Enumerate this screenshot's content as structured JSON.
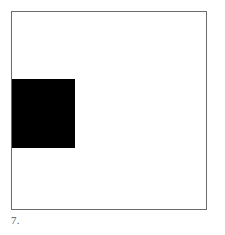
{
  "figure": {
    "caption": "7.",
    "canvas": {
      "width": 225,
      "height": 235,
      "background_color": "#ffffff"
    },
    "frame": {
      "name": "outer-square-frame",
      "stroke_color": "#6b6b6b",
      "stroke_width": 1,
      "fill_color": "#ffffff",
      "x": 11,
      "y": 11,
      "width": 196,
      "height": 199
    },
    "shapes": [
      {
        "name": "black-square",
        "type": "rectangle",
        "fill_color": "#000000",
        "x": 11,
        "y": 78,
        "width": 63,
        "height": 69,
        "anchor": "flush-left-inside-frame"
      }
    ]
  }
}
